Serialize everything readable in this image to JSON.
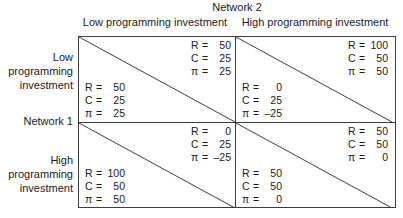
{
  "matrix": {
    "column_header_title": "Network 2",
    "row_header_title": "Network 1",
    "column_labels": [
      "Low programming investment",
      "High programming investment"
    ],
    "row_labels": [
      "Low\nprogramming\ninvestment",
      "High\nprogramming\ninvestment"
    ],
    "row_labels_lines": [
      [
        "Low",
        "programming",
        "investment"
      ],
      [
        "High",
        "programming",
        "investment"
      ]
    ],
    "symbols": {
      "revenue": "R",
      "cost": "C",
      "profit": "π",
      "equals": "="
    },
    "cells": [
      [
        {
          "upper": {
            "R": "50",
            "C": "25",
            "pi": "25"
          },
          "lower": {
            "R": "50",
            "C": "25",
            "pi": "25"
          }
        },
        {
          "upper": {
            "R": "100",
            "C": "50",
            "pi": "50"
          },
          "lower": {
            "R": "0",
            "C": "25",
            "pi": "–25"
          }
        }
      ],
      [
        {
          "upper": {
            "R": "0",
            "C": "25",
            "pi": "–25"
          },
          "lower": {
            "R": "100",
            "C": "50",
            "pi": "50"
          }
        },
        {
          "upper": {
            "R": "50",
            "C": "50",
            "pi": "0"
          },
          "lower": {
            "R": "50",
            "C": "50",
            "pi": "0"
          }
        }
      ]
    ],
    "colors": {
      "line": "#3d3d3d",
      "text": "#1a1a1a",
      "background": "#ffffff"
    }
  }
}
